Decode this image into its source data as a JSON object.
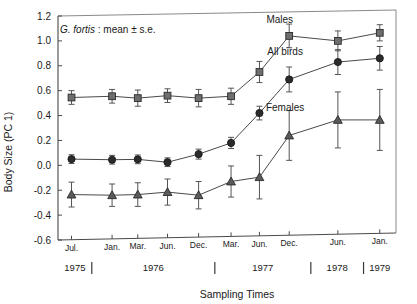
{
  "figure": {
    "annotation": "G. fortis : mean ± s.e.",
    "annotation_italic_part": "G. fortis",
    "annotation_rest": " : mean ± s.e."
  },
  "chart_data": {
    "type": "line",
    "title": "",
    "xlabel": "Sampling Times",
    "ylabel": "Body Size (PC 1)",
    "ylim": [
      -0.6,
      1.2
    ],
    "yticks": [
      -0.6,
      -0.4,
      -0.2,
      0.0,
      0.2,
      0.4,
      0.6,
      0.8,
      1.0,
      1.2
    ],
    "ytick_labels": [
      "-0.6",
      "-0.4",
      "-0.2",
      "0.0",
      "0.2",
      "0.4",
      "0.6",
      "0.8",
      "1.0",
      "1.2"
    ],
    "grid": false,
    "legend_position": "inline-annotations",
    "categories": [
      "Jul.",
      "Jan.",
      "Mar.",
      "Jun.",
      "Dec.",
      "Mar.",
      "Jun.",
      "Dec.",
      "Jun.",
      "Jan."
    ],
    "x_positions": [
      0.5,
      2.0,
      2.95,
      4.05,
      5.2,
      6.4,
      7.45,
      8.55,
      10.35,
      11.9
    ],
    "year_groups": [
      {
        "label": "1975",
        "start": 0.0,
        "end": 1.25
      },
      {
        "label": "1976",
        "start": 1.25,
        "end": 5.8
      },
      {
        "label": "1977",
        "start": 5.8,
        "end": 9.35
      },
      {
        "label": "1978",
        "start": 9.35,
        "end": 11.3
      },
      {
        "label": "1979",
        "start": 11.3,
        "end": 12.5
      }
    ],
    "series": [
      {
        "name": "Males",
        "marker": "square",
        "color": "#6e6e6e",
        "values": [
          0.545,
          0.555,
          0.54,
          0.56,
          0.54,
          0.555,
          0.75,
          1.04,
          1.0,
          1.065
        ],
        "errors": [
          0.055,
          0.055,
          0.065,
          0.055,
          0.07,
          0.065,
          0.085,
          0.095,
          0.08,
          0.065
        ]
      },
      {
        "name": "All birds",
        "marker": "circle",
        "color": "#2b2b2b",
        "values": [
          0.05,
          0.045,
          0.048,
          0.025,
          0.09,
          0.18,
          0.42,
          0.69,
          0.83,
          0.86
        ],
        "errors": [
          0.035,
          0.035,
          0.035,
          0.035,
          0.04,
          0.045,
          0.055,
          0.1,
          0.1,
          0.095
        ]
      },
      {
        "name": "Females",
        "marker": "triangle",
        "color": "#5a5a5a",
        "values": [
          -0.235,
          -0.24,
          -0.235,
          -0.215,
          -0.24,
          -0.13,
          -0.095,
          0.24,
          0.365,
          0.365
        ],
        "errors": [
          0.1,
          0.09,
          0.095,
          0.105,
          0.11,
          0.125,
          0.175,
          0.2,
          0.225,
          0.245
        ]
      }
    ],
    "series_labels": [
      {
        "text": "Males",
        "x": 8.2,
        "y": 1.145
      },
      {
        "text": "All birds",
        "x": 8.4,
        "y": 0.885
      },
      {
        "text": "Females",
        "x": 8.4,
        "y": 0.44
      }
    ]
  }
}
